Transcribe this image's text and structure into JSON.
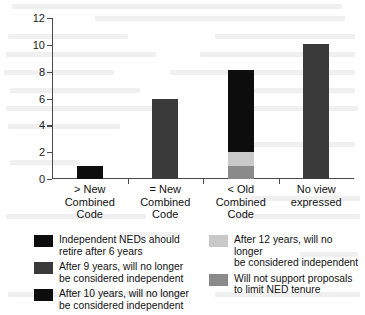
{
  "chart_data": {
    "type": "bar",
    "stacked": true,
    "title": "",
    "xlabel": "",
    "ylabel": "Number of Institutions",
    "ylim": [
      0,
      12
    ],
    "yticks": [
      0,
      2,
      4,
      6,
      8,
      10,
      12
    ],
    "ytick_labels": [
      "0",
      "2",
      "4",
      "6",
      "8",
      "10",
      "12"
    ],
    "grid": false,
    "legend_position": "below",
    "categories": [
      "> New\nCombined\nCode",
      "= New\nCombined\nCode",
      "< Old\nCombined\nCode",
      "No view\nexpressed"
    ],
    "series": [
      {
        "name": "Independent NEDs ahould\nretire after 6 years",
        "color": "#0d0d0d",
        "values": [
          1,
          0,
          0,
          0
        ]
      },
      {
        "name": "After 9 years, will no longer\nbe considered independent",
        "color": "#3a3a3a",
        "values": [
          0,
          6,
          0,
          10.1
        ]
      },
      {
        "name": "After 10 years, will no longer\nbe considered independent",
        "color": "#0d0d0d",
        "values": [
          0,
          0,
          6.1,
          0
        ]
      },
      {
        "name": "After 12 years, will no longer\nbe considered independent",
        "color": "#c9c9c9",
        "values": [
          0,
          0,
          1.0,
          0
        ]
      },
      {
        "name": "Will not support proposals\nto limit NED tenure",
        "color": "#8a8a8a",
        "values": [
          0,
          0,
          1.0,
          0
        ]
      }
    ],
    "category_totals": [
      1,
      6,
      8.1,
      10.1
    ],
    "stack_order": [
      "Will not support proposals\nto limit NED tenure",
      "After 12 years, will no longer\nbe considered independent",
      "After 10 years, will no longer\nbe considered independent"
    ]
  },
  "legend": {
    "left_column": [
      {
        "swatch_color": "#0d0d0d",
        "label": "Independent NEDs ahould\nretire after 6 years"
      },
      {
        "swatch_color": "#3a3a3a",
        "label": "After 9 years, will no longer\nbe considered independent"
      },
      {
        "swatch_color": "#0d0d0d",
        "label": "After 10 years, will no longer\nbe considered independent"
      }
    ],
    "right_column": [
      {
        "swatch_color": "#c9c9c9",
        "label": "After 12 years, will no longer\nbe considered independent"
      },
      {
        "swatch_color": "#8a8a8a",
        "label": "Will not support proposals\nto limit NED tenure"
      }
    ]
  }
}
